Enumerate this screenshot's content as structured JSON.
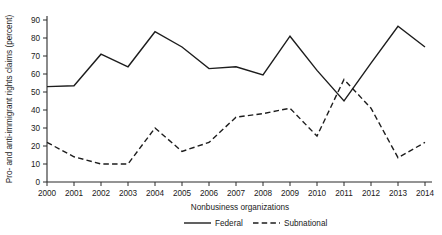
{
  "chart_data": {
    "type": "line",
    "title": "",
    "subtitle": "",
    "xlabel": "Nonbusiness organizations",
    "ylabel": "Pro- and anti-immigrant rights claims (percent)",
    "x": [
      2000,
      2001,
      2002,
      2003,
      2004,
      2005,
      2006,
      2007,
      2008,
      2009,
      2010,
      2011,
      2012,
      2013,
      2014
    ],
    "xticklabels": [
      "2000",
      "2001",
      "2002",
      "2003",
      "2004",
      "2005",
      "2006",
      "2007",
      "2008",
      "2009",
      "2010",
      "2011",
      "2012",
      "2013",
      "2014"
    ],
    "yticklabels": [
      "0",
      "10",
      "20",
      "30",
      "40",
      "50",
      "60",
      "70",
      "80",
      "90"
    ],
    "yticks": [
      0,
      10,
      20,
      30,
      40,
      50,
      60,
      70,
      80,
      90
    ],
    "xlim": [
      2000,
      2014
    ],
    "ylim": [
      0,
      93
    ],
    "grid": false,
    "legend_position": "bottom-center",
    "series": [
      {
        "name": "Federal",
        "style": "solid",
        "color": "#1d1d1d",
        "values": [
          53,
          53.5,
          71,
          64,
          83.5,
          75,
          63,
          64,
          59.5,
          81,
          62,
          45,
          66,
          86.5,
          75
        ]
      },
      {
        "name": "Subnational",
        "style": "dashed",
        "color": "#1d1d1d",
        "values": [
          22,
          14,
          10,
          10,
          30,
          17,
          22,
          36,
          38,
          41,
          25.5,
          57,
          41,
          13.5,
          22
        ]
      }
    ]
  },
  "legend": {
    "entries": [
      {
        "label": "Federal"
      },
      {
        "label": "Subnational"
      }
    ]
  }
}
